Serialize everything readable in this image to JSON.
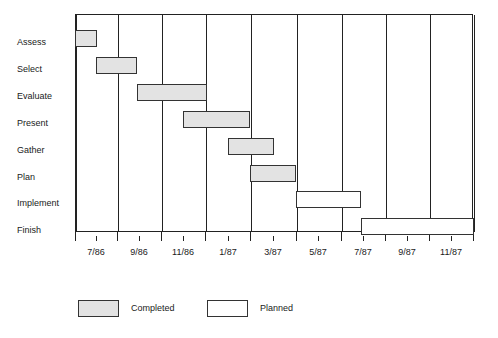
{
  "chart_data": {
    "type": "bar",
    "subtype": "gantt",
    "title": "",
    "xlabel": "",
    "ylabel": "",
    "grid": true,
    "legend_position": "bottom-left",
    "x_axis": {
      "start": "6/86",
      "end": "12/87",
      "tick_labels": [
        "7/86",
        "9/86",
        "11/86",
        "1/87",
        "3/87",
        "5/87",
        "7/87",
        "9/87",
        "11/87"
      ],
      "gridline_count": 10,
      "unit": "month"
    },
    "categories": [
      "Assess",
      "Select",
      "Evaluate",
      "Present",
      "Gather",
      "Plan",
      "Implement",
      "Finish"
    ],
    "series": [
      {
        "name": "Completed",
        "color": "#e3e3e3",
        "tasks": [
          {
            "task": "Assess",
            "start": "6/86",
            "end": "7/86"
          },
          {
            "task": "Select",
            "start": "7/86",
            "end": "9/86"
          },
          {
            "task": "Evaluate",
            "start": "9/86",
            "end": "12/86"
          },
          {
            "task": "Present",
            "start": "11/86",
            "end": "1/87"
          },
          {
            "task": "Gather",
            "start": "1/87",
            "end": "3/87"
          },
          {
            "task": "Plan",
            "start": "2/87",
            "end": "4/87"
          }
        ]
      },
      {
        "name": "Planned",
        "color": "#ffffff",
        "tasks": [
          {
            "task": "Implement",
            "start": "4/87",
            "end": "7/87"
          },
          {
            "task": "Finish",
            "start": "7/87",
            "end": "12/87"
          }
        ]
      }
    ]
  },
  "axis": {
    "ticks": [
      {
        "label": "7/86",
        "x": 96
      },
      {
        "label": "9/86",
        "x": 139
      },
      {
        "label": "11/86",
        "x": 183
      },
      {
        "label": "1/87",
        "x": 228
      },
      {
        "label": "3/87",
        "x": 273
      },
      {
        "label": "5/87",
        "x": 318
      },
      {
        "label": "7/87",
        "x": 363
      },
      {
        "label": "9/87",
        "x": 407
      },
      {
        "label": "11/87",
        "x": 451
      }
    ],
    "gridlines": [
      75,
      117,
      161,
      205,
      250,
      296,
      341,
      385,
      429,
      473
    ]
  },
  "rows": [
    {
      "label": "Assess",
      "label_y": 37,
      "bar_x": 75,
      "bar_w": 22,
      "bar_y": 30,
      "type": "completed"
    },
    {
      "label": "Select",
      "label_y": 64,
      "bar_x": 96,
      "bar_w": 41,
      "bar_y": 57,
      "type": "completed"
    },
    {
      "label": "Evaluate",
      "label_y": 91,
      "bar_x": 137,
      "bar_w": 70,
      "bar_y": 84,
      "type": "completed"
    },
    {
      "label": "Present",
      "label_y": 118,
      "bar_x": 183,
      "bar_w": 67,
      "bar_y": 111,
      "type": "completed"
    },
    {
      "label": "Gather",
      "label_y": 145,
      "bar_x": 228,
      "bar_w": 46,
      "bar_y": 138,
      "type": "completed"
    },
    {
      "label": "Plan",
      "label_y": 172,
      "bar_x": 250,
      "bar_w": 46,
      "bar_y": 165,
      "type": "completed"
    },
    {
      "label": "Implement",
      "label_y": 198,
      "bar_x": 296,
      "bar_w": 65,
      "bar_y": 191,
      "type": "planned"
    },
    {
      "label": "Finish",
      "label_y": 225,
      "bar_x": 361,
      "bar_w": 113,
      "bar_y": 218,
      "type": "planned"
    }
  ],
  "legend": {
    "items": [
      {
        "label": "Completed",
        "type": "completed",
        "swatch_x": 78,
        "text_x": 131
      },
      {
        "label": "Planned",
        "type": "planned",
        "swatch_x": 207,
        "text_x": 260
      }
    ],
    "y": 300,
    "text_y": 303
  }
}
